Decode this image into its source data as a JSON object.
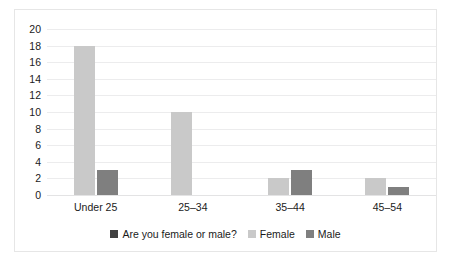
{
  "chart_data": {
    "type": "bar",
    "title": "",
    "xlabel": "",
    "ylabel": "",
    "categories": [
      "Under 25",
      "25–34",
      "35–44",
      "45–54"
    ],
    "series": [
      {
        "name": "Female",
        "values": [
          18,
          10,
          2,
          2
        ],
        "color": "#c9c9c9"
      },
      {
        "name": "Male",
        "values": [
          3,
          0,
          3,
          1
        ],
        "color": "#7f7f7f"
      }
    ],
    "ylim": [
      0,
      20
    ],
    "ytick_step": 2,
    "yticks": [
      "20",
      "18",
      "16",
      "14",
      "12",
      "10",
      "8",
      "6",
      "4",
      "2",
      "0"
    ],
    "grid": "horizontal",
    "legend_position": "bottom",
    "legend": [
      {
        "label": "Are you female or male?",
        "color": "#404040"
      },
      {
        "label": "Female",
        "color": "#c9c9c9"
      },
      {
        "label": "Male",
        "color": "#7f7f7f"
      }
    ],
    "border_color": "#e6e6e6",
    "gridline_color": "#ececed",
    "text_color": "#1a1a1a"
  }
}
